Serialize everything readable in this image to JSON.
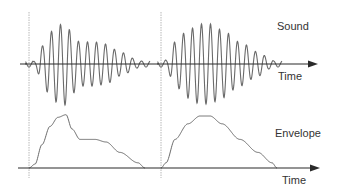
{
  "labels": {
    "sound": "Sound",
    "envelope": "Envelope",
    "time_top": "Time",
    "time_bottom": "Time"
  },
  "colors": {
    "wave": "#6a6a6a",
    "axis": "#2a2a2a",
    "divider": "#b8b8b8",
    "text": "#333333",
    "background": "#ffffff"
  },
  "axes": {
    "sound_axis": {
      "y": 64,
      "x_start": 20,
      "x_end": 318
    },
    "envelope_axis": {
      "y": 168,
      "x_start": 18,
      "x_end": 320
    }
  },
  "dividers": [
    {
      "x": 29,
      "y_start": 12,
      "y_end": 178
    },
    {
      "x": 161,
      "y_start": 12,
      "y_end": 178
    }
  ],
  "events": [
    {
      "name": "first-sound",
      "onset_x": 29,
      "period_px": 9,
      "envelope_points": [
        [
          29,
          0
        ],
        [
          35,
          3
        ],
        [
          42,
          18
        ],
        [
          50,
          32
        ],
        [
          58,
          39
        ],
        [
          66,
          41
        ],
        [
          72,
          30
        ],
        [
          80,
          22
        ],
        [
          95,
          22
        ],
        [
          106,
          20
        ],
        [
          120,
          12
        ],
        [
          138,
          4
        ],
        [
          145,
          0
        ]
      ],
      "tail_end_x": 150
    },
    {
      "name": "second-sound",
      "onset_x": 161,
      "period_px": 9,
      "envelope_points": [
        [
          161,
          0
        ],
        [
          166,
          4
        ],
        [
          175,
          22
        ],
        [
          188,
          34
        ],
        [
          200,
          40
        ],
        [
          210,
          40
        ],
        [
          222,
          34
        ],
        [
          240,
          22
        ],
        [
          258,
          12
        ],
        [
          272,
          4
        ],
        [
          277,
          0
        ]
      ],
      "tail_end_x": 282
    }
  ],
  "envelope_panel": {
    "baseline_y": 168,
    "scale": 1.3
  }
}
